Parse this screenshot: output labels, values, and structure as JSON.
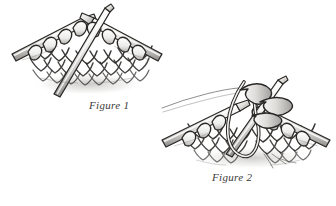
{
  "page": {
    "background_color": "#ffffff",
    "width": 336,
    "height": 206,
    "style": "pen-and-ink line illustration"
  },
  "figures": [
    {
      "id": "figure-1",
      "caption": "Figure 1",
      "caption_position": {
        "x": 89,
        "y": 99
      },
      "description": "Two knitting needles held parallel with stitches, a third needle inserted through the first stitch on each needle",
      "needles": 3,
      "ink_color": "#262422",
      "needle_fill": "#e8e8e6",
      "needle_highlight": "#fbfbfa"
    },
    {
      "id": "figure-2",
      "caption": "Figure 2",
      "caption_position": {
        "x": 212,
        "y": 171
      },
      "description": "A loop of yarn pulled through the two stitches with the working yarn tail trailing to the left",
      "needles": 3,
      "ink_color": "#262422",
      "needle_fill": "#e8e8e6",
      "needle_highlight": "#fbfbfa"
    }
  ],
  "colors": {
    "ink": "#262422",
    "mid_gray": "#8c8a88",
    "light_gray": "#d7d6d3",
    "paper": "#ffffff",
    "caption_text": "#3b3a38"
  }
}
